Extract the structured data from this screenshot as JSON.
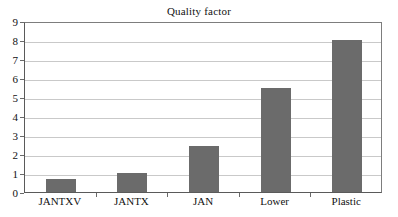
{
  "chart_data": {
    "type": "bar",
    "title": "Quality factor",
    "xlabel": "",
    "ylabel": "",
    "categories": [
      "JANTXV",
      "JANTX",
      "JAN",
      "Lower",
      "Plastic"
    ],
    "values": [
      0.7,
      1.0,
      2.4,
      5.5,
      8.0
    ],
    "ylim": [
      0,
      9
    ],
    "ytick_labels": [
      "0",
      "1",
      "2",
      "3",
      "4",
      "5",
      "6",
      "7",
      "8",
      "9"
    ],
    "ytick_values": [
      0,
      1,
      2,
      3,
      4,
      5,
      6,
      7,
      8,
      9
    ],
    "grid": true,
    "legend": false,
    "legend_position": "none",
    "series": [
      {
        "name": "Quality factor",
        "values": [
          0.7,
          1.0,
          2.4,
          5.5,
          8.0
        ],
        "color": "#6b6b6b"
      }
    ]
  },
  "colors": {
    "bar_fill": "#6b6b6b",
    "gridline": "#c9c9c9",
    "axis": "#5a5a5a",
    "background": "#ffffff",
    "text": "#111111"
  }
}
